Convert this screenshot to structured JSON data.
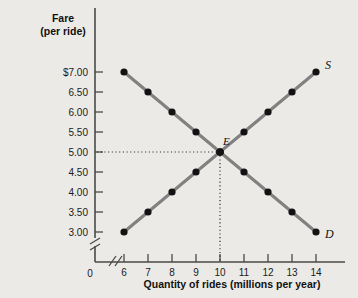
{
  "chart_data": {
    "type": "line",
    "title": "",
    "ylabel_line1": "Fare",
    "ylabel_line2": "(per ride)",
    "xlabel": "Quantity of rides (millions per year)",
    "origin_label": "0",
    "x": [
      6,
      7,
      8,
      9,
      10,
      11,
      12,
      13,
      14
    ],
    "xtick_labels": [
      "6",
      "7",
      "8",
      "9",
      "10",
      "11",
      "12",
      "13",
      "14"
    ],
    "ytick_labels": [
      "$7.00",
      "6.50",
      "6.00",
      "5.50",
      "5.00",
      "4.50",
      "4.00",
      "3.50",
      "3.00"
    ],
    "ytick_values": [
      7.0,
      6.5,
      6.0,
      5.5,
      5.0,
      4.5,
      4.0,
      3.5,
      3.0
    ],
    "xlim": [
      6,
      14
    ],
    "ylim": [
      3.0,
      7.0
    ],
    "grid": false,
    "legend_position": "curve-end-labels",
    "axis_break_x": true,
    "axis_break_y": true,
    "series": [
      {
        "name": "Demand",
        "label": "D",
        "color": "#808080",
        "marker_color": "#121212",
        "values": [
          7.0,
          6.5,
          6.0,
          5.5,
          5.0,
          4.5,
          4.0,
          3.5,
          3.0
        ]
      },
      {
        "name": "Supply",
        "label": "S",
        "color": "#808080",
        "marker_color": "#121212",
        "values": [
          3.0,
          3.5,
          4.0,
          4.5,
          5.0,
          5.5,
          6.0,
          6.5,
          7.0
        ]
      }
    ],
    "annotations": [
      {
        "name": "equilibrium",
        "label": "E",
        "x": 10,
        "y": 5.0,
        "guides": [
          "horizontal",
          "vertical"
        ]
      }
    ]
  }
}
